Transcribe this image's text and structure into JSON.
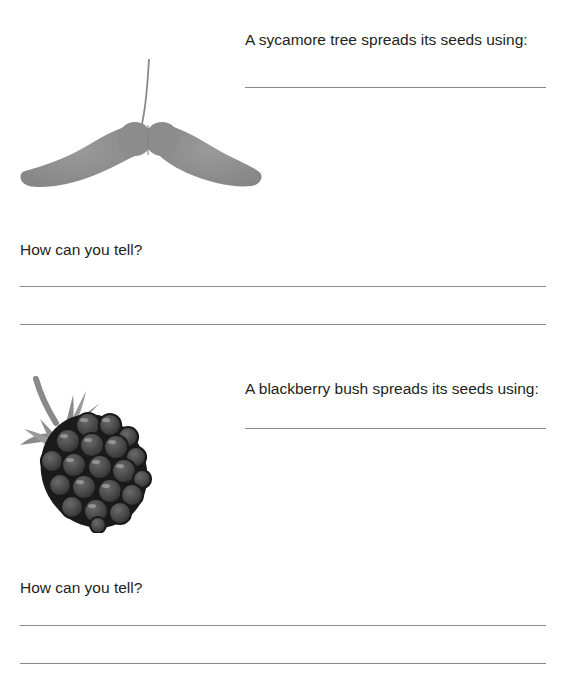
{
  "worksheet": {
    "questions": [
      {
        "id": "sycamore",
        "illustration": "sycamore-seed-icon",
        "prompt": "A sycamore tree spreads its seeds using:",
        "follow_up": "How can you tell?",
        "answer_lines": {
          "dispersal": 1,
          "explanation": 2
        }
      },
      {
        "id": "blackberry",
        "illustration": "blackberry-icon",
        "prompt": "A blackberry bush spreads its seeds using:",
        "follow_up": "How can you tell?",
        "answer_lines": {
          "dispersal": 1,
          "explanation": 2
        }
      }
    ]
  },
  "colors": {
    "text": "#231f20",
    "line": "#8a8a8a",
    "sycamore_wing": "#8f8f8f",
    "blackberry_drupe": "#4a4a4a",
    "blackberry_outline": "#1a1a1a",
    "leaf": "#7a7a7a"
  }
}
